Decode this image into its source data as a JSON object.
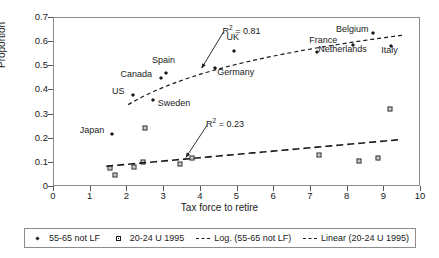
{
  "chart_data": {
    "type": "scatter",
    "title": "",
    "xlabel": "Tax force to retire",
    "ylabel": "Proportion",
    "xlim": [
      0,
      10
    ],
    "ylim": [
      0,
      0.7
    ],
    "xticks": [
      "0",
      "1",
      "2",
      "3",
      "4",
      "5",
      "6",
      "7",
      "8",
      "9",
      "10"
    ],
    "yticks": [
      "0",
      "0.1",
      "0.2",
      "0.3",
      "0.4",
      "0.5",
      "0.6",
      "0.7"
    ],
    "grid": false,
    "legend_position": "bottom",
    "series": [
      {
        "name": "55-65 not LF",
        "marker": "diamond",
        "points": [
          {
            "label": "Japan",
            "x": 1.6,
            "y": 0.215,
            "label_dx": -32,
            "label_dy": -4
          },
          {
            "label": "US",
            "x": 2.18,
            "y": 0.378,
            "label_dx": -21,
            "label_dy": -4
          },
          {
            "label": "Sweden",
            "x": 2.72,
            "y": 0.355,
            "label_dx": 5,
            "label_dy": 3
          },
          {
            "label": "Canada",
            "x": 2.93,
            "y": 0.447,
            "label_dx": -40,
            "label_dy": -4
          },
          {
            "label": "Spain",
            "x": 3.08,
            "y": 0.468,
            "label_dx": -14,
            "label_dy": -13
          },
          {
            "label": "Germany",
            "x": 4.42,
            "y": 0.487,
            "label_dx": 2,
            "label_dy": 4
          },
          {
            "label": "UK",
            "x": 4.92,
            "y": 0.558,
            "label_dx": -7,
            "label_dy": -14
          },
          {
            "label": "France",
            "x": 7.2,
            "y": 0.553,
            "label_dx": -8,
            "label_dy": -12
          },
          {
            "label": "Netherlands",
            "x": 8.18,
            "y": 0.585,
            "label_dx": -35,
            "label_dy": 4
          },
          {
            "label": "Belgium",
            "x": 8.72,
            "y": 0.635,
            "label_dx": -37,
            "label_dy": -4
          },
          {
            "label": "Italy",
            "x": 9.22,
            "y": 0.58,
            "label_dx": -10,
            "label_dy": 4
          }
        ]
      },
      {
        "name": "20-24 U 1995",
        "marker": "square",
        "points": [
          {
            "label": "",
            "x": 1.55,
            "y": 0.073
          },
          {
            "label": "",
            "x": 1.68,
            "y": 0.045
          },
          {
            "label": "",
            "x": 2.2,
            "y": 0.078
          },
          {
            "label": "",
            "x": 2.46,
            "y": 0.1
          },
          {
            "label": "",
            "x": 2.52,
            "y": 0.24
          },
          {
            "label": "",
            "x": 3.45,
            "y": 0.09
          },
          {
            "label": "",
            "x": 3.78,
            "y": 0.118
          },
          {
            "label": "",
            "x": 7.25,
            "y": 0.128
          },
          {
            "label": "",
            "x": 8.35,
            "y": 0.105
          },
          {
            "label": "",
            "x": 8.85,
            "y": 0.115
          },
          {
            "label": "",
            "x": 9.18,
            "y": 0.32
          }
        ]
      }
    ],
    "trendlines": [
      {
        "name": "Log. (55-65 not LF)",
        "style": "dashed",
        "kind": "log",
        "x_start": 2.05,
        "x_end": 9.55,
        "y_start": 0.337,
        "y_end": 0.625
      },
      {
        "name": "Linear (20-24 U 1995)",
        "style": "dash-long",
        "kind": "linear",
        "x_start": 1.45,
        "x_end": 9.45,
        "y_start": 0.082,
        "y_end": 0.192
      }
    ],
    "annotations": [
      {
        "text": "R² = 0.81",
        "x": 4.62,
        "y": 0.655,
        "arrow_to_x": 4.05,
        "arrow_to_y": 0.488
      },
      {
        "text": "R² = 0.23",
        "x": 4.17,
        "y": 0.268,
        "arrow_to_x": 3.62,
        "arrow_to_y": 0.118
      }
    ]
  },
  "legend": {
    "items": [
      {
        "label": "55-65 not LF",
        "symbol": "diamond-marker"
      },
      {
        "label": "20-24 U 1995",
        "symbol": "square-marker"
      },
      {
        "label": "Log. (55-65 not LF)",
        "symbol": "dashed-line"
      },
      {
        "label": "Linear (20-24 U 1995)",
        "symbol": "dash-long-line"
      }
    ]
  },
  "colors": {
    "foreground": "#1a1a1a",
    "axis": "#8c8c8c",
    "background": "#ffffff"
  }
}
